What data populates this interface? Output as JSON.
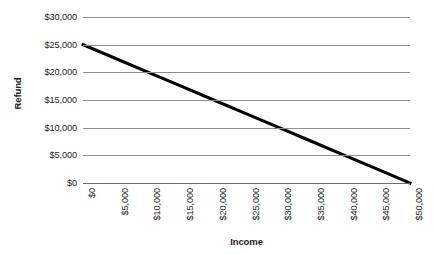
{
  "chart_data": {
    "type": "line",
    "title": "",
    "xlabel": "Income",
    "ylabel": "Refund",
    "xlim": [
      0,
      50000
    ],
    "ylim": [
      0,
      30000
    ],
    "grid": true,
    "legend": false,
    "legend_position": "none",
    "line_color": "#000000",
    "gridline_color": "#8d8d8d",
    "background_color": "#ffffff",
    "x_tick_labels": [
      "$0",
      "$5,000",
      "$10,000",
      "$15,000",
      "$20,000",
      "$25,000",
      "$30,000",
      "$35,000",
      "$40,000",
      "$45,000",
      "$50,000"
    ],
    "x_tick_values": [
      0,
      5000,
      10000,
      15000,
      20000,
      25000,
      30000,
      35000,
      40000,
      45000,
      50000
    ],
    "y_tick_labels": [
      "$30,000",
      "$25,000",
      "$20,000",
      "$15,000",
      "$10,000",
      "$5,000",
      "$0"
    ],
    "y_tick_values": [
      30000,
      25000,
      20000,
      15000,
      10000,
      5000,
      0
    ],
    "x_tick_rotation": 90,
    "series": [
      {
        "name": "Refund",
        "x": [
          0,
          50000
        ],
        "values": [
          25000,
          0
        ],
        "points": [
          {
            "x": 0,
            "y": 25000
          },
          {
            "x": 5000,
            "y": 22500
          },
          {
            "x": 10000,
            "y": 20000
          },
          {
            "x": 15000,
            "y": 17500
          },
          {
            "x": 20000,
            "y": 15000
          },
          {
            "x": 25000,
            "y": 12500
          },
          {
            "x": 30000,
            "y": 10000
          },
          {
            "x": 35000,
            "y": 7500
          },
          {
            "x": 40000,
            "y": 5000
          },
          {
            "x": 45000,
            "y": 2500
          },
          {
            "x": 50000,
            "y": 0
          }
        ]
      }
    ]
  }
}
